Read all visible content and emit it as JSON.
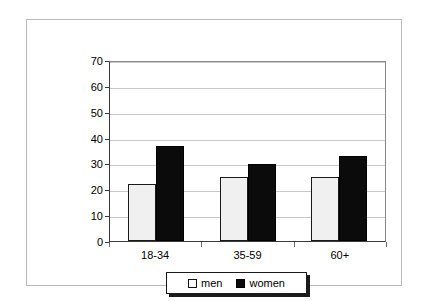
{
  "chart_data": {
    "type": "bar",
    "title": "",
    "subtitle": "",
    "xlabel": "",
    "ylabel": "",
    "categories": [
      "18-34",
      "35-59",
      "60+"
    ],
    "series": [
      {
        "name": "men",
        "values": [
          22,
          25,
          25
        ],
        "color": "#f0f0f0",
        "border_color": "#1a1a1a"
      },
      {
        "name": "women",
        "values": [
          37,
          30,
          33
        ],
        "color": "#0b0b0b",
        "border_color": "#000000"
      }
    ],
    "ylim": [
      0,
      70
    ],
    "ytick_step": 10,
    "yticks": [
      0,
      10,
      20,
      30,
      40,
      50,
      60,
      70
    ],
    "ytick_labels": [
      "0",
      "10",
      "20",
      "30",
      "40",
      "50",
      "60",
      "70"
    ],
    "grid": true,
    "grid_axis": "y",
    "grid_color": "#c8c8c8",
    "legend_position": "bottom",
    "legend_entries": [
      "men",
      "women"
    ],
    "annotations": [],
    "frame": true,
    "background": "#ffffff"
  }
}
